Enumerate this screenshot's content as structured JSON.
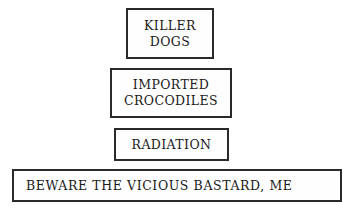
{
  "signs": [
    {
      "lines": [
        "KILLER",
        "DOGS"
      ]
    },
    {
      "lines": [
        "IMPORTED",
        "CROCODILES"
      ]
    },
    {
      "lines": [
        "RADIATION"
      ]
    },
    {
      "lines": [
        "BEWARE THE VICIOUS BASTARD, ME"
      ]
    }
  ]
}
